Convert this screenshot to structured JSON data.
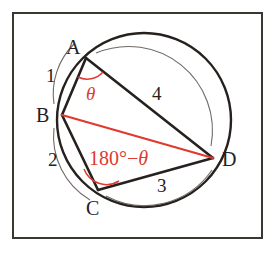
{
  "figure": {
    "frame_color": "#3a3632",
    "background": "#ffffff",
    "ink_color": "#26211e",
    "accent_color": "#e0392e",
    "arc_marker_color": "#6f6a66"
  },
  "vertices": [
    {
      "name": "A",
      "label": "A",
      "x": 86,
      "y": 58,
      "label_x": 66,
      "label_y": 37
    },
    {
      "name": "B",
      "label": "B",
      "x": 62,
      "y": 115,
      "label_x": 36,
      "label_y": 105
    },
    {
      "name": "C",
      "label": "C",
      "x": 98,
      "y": 190,
      "label_x": 86,
      "label_y": 198
    },
    {
      "name": "D",
      "label": "D",
      "x": 213,
      "y": 158,
      "label_x": 222,
      "label_y": 149
    }
  ],
  "circle": {
    "center_x": 144,
    "center_y": 120,
    "radius": 87
  },
  "chords": [
    {
      "name": "chord-AB",
      "from": "A",
      "to": "B",
      "color": "#26211e"
    },
    {
      "name": "chord-AD",
      "from": "A",
      "to": "D",
      "color": "#26211e"
    },
    {
      "name": "chord-BC",
      "from": "B",
      "to": "C",
      "color": "#26211e"
    },
    {
      "name": "chord-CD",
      "from": "C",
      "to": "D",
      "color": "#26211e"
    },
    {
      "name": "diagonal-BD",
      "from": "B",
      "to": "D",
      "color": "#e0392e"
    }
  ],
  "arc_labels": [
    {
      "name": "arc-label-1",
      "text": "1",
      "x": 46,
      "y": 66,
      "arc": "AB"
    },
    {
      "name": "arc-label-2",
      "text": "2",
      "x": 48,
      "y": 150,
      "arc": "BC"
    },
    {
      "name": "arc-label-3",
      "text": "3",
      "x": 157,
      "y": 176,
      "arc": "CD"
    },
    {
      "name": "arc-label-4",
      "text": "4",
      "x": 152,
      "y": 84,
      "arc": "AD"
    }
  ],
  "angle_labels": {
    "theta": {
      "text": "θ",
      "x": 86,
      "y": 84,
      "vertex": "A",
      "color": "#e0392e"
    },
    "supplement": {
      "prefix": "180°−",
      "theta": "θ",
      "x": 89,
      "y": 148,
      "vertex": "C",
      "color": "#e0392e"
    }
  }
}
